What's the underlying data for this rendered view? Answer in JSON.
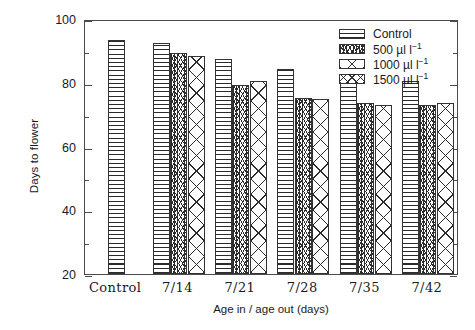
{
  "chart_data": {
    "type": "bar",
    "title": "",
    "xlabel": "Age in / age out (days)",
    "ylabel": "Days to flower",
    "ylim": [
      20,
      100
    ],
    "ytick_labels": [
      "20",
      "40",
      "60",
      "80",
      "100"
    ],
    "ytick_values": [
      20,
      40,
      60,
      80,
      100
    ],
    "yminor_values": [
      30,
      50,
      70,
      90
    ],
    "grid": false,
    "legend_position": "top-right",
    "categories": [
      "Control",
      "7/14",
      "7/21",
      "7/28",
      "7/35",
      "7/42"
    ],
    "series": [
      {
        "name": "Control",
        "values": [
          93.5,
          92.4,
          87.5,
          84.3,
          80.5,
          80.5
        ]
      },
      {
        "name": "500 µl l⁻¹",
        "values": [
          null,
          89.3,
          79.3,
          75.3,
          73.8,
          73.0
        ]
      },
      {
        "name": "1000 µl l⁻¹",
        "values": [
          null,
          88.4,
          80.4,
          74.8,
          72.9,
          73.6
        ]
      },
      {
        "name": "1500 µl l⁻¹",
        "values": [
          null,
          null,
          null,
          null,
          null,
          null
        ]
      }
    ],
    "bars": [
      {
        "group": "Control",
        "series": "Control",
        "value": 93.5,
        "pattern": "horizontal-lines"
      },
      {
        "group": "7/14",
        "series": "Control",
        "value": 92.4,
        "pattern": "horizontal-lines"
      },
      {
        "group": "7/14",
        "series": "500",
        "value": 89.3,
        "pattern": "fine-mesh"
      },
      {
        "group": "7/14",
        "series": "1000",
        "value": 88.4,
        "pattern": "large-crosshatch"
      },
      {
        "group": "7/21",
        "series": "Control",
        "value": 87.5,
        "pattern": "horizontal-lines"
      },
      {
        "group": "7/21",
        "series": "500",
        "value": 79.3,
        "pattern": "fine-mesh"
      },
      {
        "group": "7/21",
        "series": "1000",
        "value": 80.4,
        "pattern": "large-crosshatch"
      },
      {
        "group": "7/28",
        "series": "Control",
        "value": 84.3,
        "pattern": "horizontal-lines"
      },
      {
        "group": "7/28",
        "series": "500",
        "value": 75.3,
        "pattern": "fine-mesh"
      },
      {
        "group": "7/28",
        "series": "1000",
        "value": 74.8,
        "pattern": "large-crosshatch"
      },
      {
        "group": "7/35",
        "series": "Control",
        "value": 80.5,
        "pattern": "horizontal-lines"
      },
      {
        "group": "7/35",
        "series": "500",
        "value": 73.8,
        "pattern": "fine-mesh"
      },
      {
        "group": "7/35",
        "series": "1000",
        "value": 72.9,
        "pattern": "large-crosshatch"
      },
      {
        "group": "7/42",
        "series": "Control",
        "value": 80.5,
        "pattern": "horizontal-lines"
      },
      {
        "group": "7/42",
        "series": "500",
        "value": 73.0,
        "pattern": "fine-mesh"
      },
      {
        "group": "7/42",
        "series": "1000",
        "value": 73.6,
        "pattern": "large-crosshatch"
      }
    ]
  },
  "legend": {
    "items": [
      {
        "label": "Control",
        "unit": "",
        "sup": "",
        "pattern": "horizontal-lines"
      },
      {
        "label": "500",
        "unit": " µl l",
        "sup": "−1",
        "pattern": "fine-mesh"
      },
      {
        "label": "1000",
        "unit": " µl l",
        "sup": "−1",
        "pattern": "large-crosshatch"
      },
      {
        "label": "1500",
        "unit": " µl l",
        "sup": "−1",
        "pattern": "medium-crosshatch"
      }
    ]
  },
  "axes": {
    "y_title": "Days to flower",
    "x_title": "Age in / age out (days)",
    "y_ticks": [
      "100",
      "80",
      "60",
      "40",
      "20"
    ],
    "x_ticks": [
      "Control",
      "7/14",
      "7/21",
      "7/28",
      "7/35",
      "7/42"
    ]
  },
  "colors": {
    "frame": "#4a4a4a",
    "pattern_ink": "#2b2b2b",
    "background": "#ffffff",
    "text": "#1a1a1a"
  }
}
